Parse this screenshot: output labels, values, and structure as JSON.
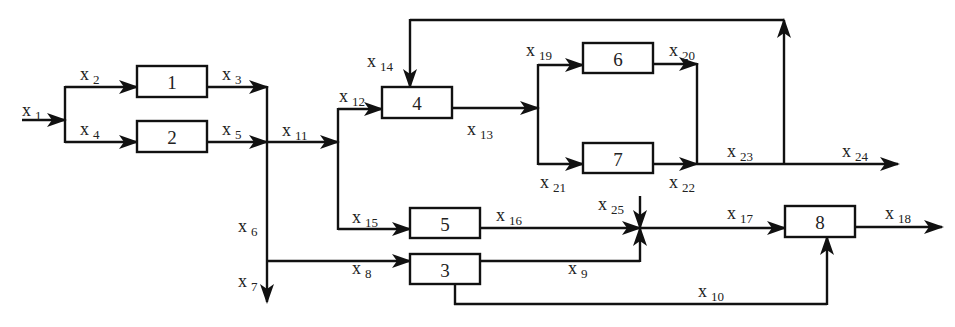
{
  "diagram": {
    "type": "process-flow-block-diagram",
    "boxes": [
      {
        "id": "1",
        "label": "1",
        "x": 137,
        "y": 66,
        "w": 70,
        "h": 31
      },
      {
        "id": "2",
        "label": "2",
        "x": 137,
        "y": 121,
        "w": 70,
        "h": 31
      },
      {
        "id": "3",
        "label": "3",
        "x": 410,
        "y": 254,
        "w": 70,
        "h": 30
      },
      {
        "id": "4",
        "label": "4",
        "x": 382,
        "y": 87,
        "w": 70,
        "h": 31
      },
      {
        "id": "5",
        "label": "5",
        "x": 410,
        "y": 208,
        "w": 70,
        "h": 30
      },
      {
        "id": "6",
        "label": "6",
        "x": 583,
        "y": 43,
        "w": 70,
        "h": 30
      },
      {
        "id": "7",
        "label": "7",
        "x": 583,
        "y": 143,
        "w": 70,
        "h": 30
      },
      {
        "id": "8",
        "label": "8",
        "x": 785,
        "y": 206,
        "w": 70,
        "h": 31
      }
    ],
    "streams": [
      {
        "name": "x",
        "sub": "1",
        "x": 22,
        "y": 116
      },
      {
        "name": "x",
        "sub": "2",
        "x": 80,
        "y": 80
      },
      {
        "name": "x",
        "sub": "3",
        "x": 222,
        "y": 80
      },
      {
        "name": "x",
        "sub": "4",
        "x": 80,
        "y": 135
      },
      {
        "name": "x",
        "sub": "5",
        "x": 222,
        "y": 135
      },
      {
        "name": "x",
        "sub": "6",
        "x": 238,
        "y": 232
      },
      {
        "name": "x",
        "sub": "7",
        "x": 238,
        "y": 287
      },
      {
        "name": "x",
        "sub": "8",
        "x": 352,
        "y": 274
      },
      {
        "name": "x",
        "sub": "9",
        "x": 568,
        "y": 274
      },
      {
        "name": "x",
        "sub": "10",
        "x": 698,
        "y": 297
      },
      {
        "name": "x",
        "sub": "11",
        "x": 282,
        "y": 136
      },
      {
        "name": "x",
        "sub": "12",
        "x": 339,
        "y": 102
      },
      {
        "name": "x",
        "sub": "13",
        "x": 467,
        "y": 135
      },
      {
        "name": "x",
        "sub": "14",
        "x": 367,
        "y": 67
      },
      {
        "name": "x",
        "sub": "15",
        "x": 352,
        "y": 223
      },
      {
        "name": "x",
        "sub": "16",
        "x": 496,
        "y": 221
      },
      {
        "name": "x",
        "sub": "17",
        "x": 727,
        "y": 219
      },
      {
        "name": "x",
        "sub": "18",
        "x": 885,
        "y": 219
      },
      {
        "name": "x",
        "sub": "19",
        "x": 526,
        "y": 56
      },
      {
        "name": "x",
        "sub": "20",
        "x": 669,
        "y": 56
      },
      {
        "name": "x",
        "sub": "21",
        "x": 540,
        "y": 188
      },
      {
        "name": "x",
        "sub": "22",
        "x": 669,
        "y": 188
      },
      {
        "name": "x",
        "sub": "23",
        "x": 727,
        "y": 157
      },
      {
        "name": "x",
        "sub": "24",
        "x": 842,
        "y": 157
      },
      {
        "name": "x",
        "sub": "25",
        "x": 598,
        "y": 210
      }
    ]
  }
}
